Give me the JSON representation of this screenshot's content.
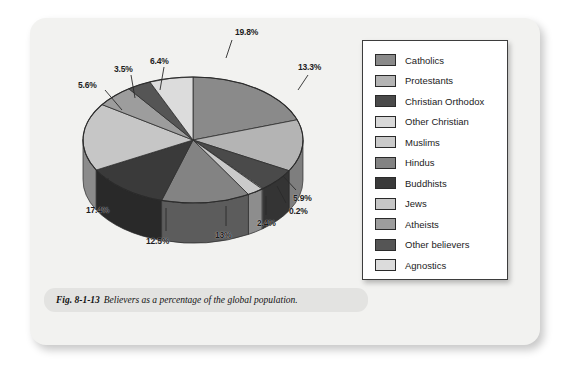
{
  "figure": {
    "caption_prefix": "Fig. 8-1-13",
    "caption_text": "Believers as a percentage of the global population.",
    "background_color": "#f2f2f0",
    "caption_bar_color": "#e3e3e1"
  },
  "chart_data": {
    "type": "pie",
    "title": "Believers as a percentage of the global population",
    "three_d": true,
    "legend_position": "right",
    "categories": [
      "Catholics",
      "Protestants",
      "Christian Orthodox",
      "Other Christian",
      "Muslims",
      "Hindus",
      "Buddhists",
      "Jews",
      "Atheists",
      "Other believers",
      "Agnostics"
    ],
    "values": [
      19.8,
      13.3,
      5.9,
      0.2,
      2.4,
      13,
      12.5,
      17.4,
      5.6,
      3.5,
      6.4
    ],
    "value_labels": [
      "19.8%",
      "13.3%",
      "5.9%",
      "0.2%",
      "2.4%",
      "13%",
      "12.5%",
      "17.4%",
      "5.6%",
      "3.5%",
      "6.4%"
    ],
    "colors": [
      "#8a8a8a",
      "#b4b4b4",
      "#4a4a4a",
      "#d8d8d8",
      "#cacaca",
      "#838383",
      "#3a3a3a",
      "#c6c6c6",
      "#9d9d9d",
      "#555555",
      "#dcdcdc"
    ],
    "units": "percent",
    "total": 100
  },
  "legend": {
    "items": [
      {
        "label": "Catholics",
        "color": "#8a8a8a"
      },
      {
        "label": "Protestants",
        "color": "#b4b4b4"
      },
      {
        "label": "Christian Orthodox",
        "color": "#4a4a4a"
      },
      {
        "label": "Other Christian",
        "color": "#d8d8d8"
      },
      {
        "label": "Muslims",
        "color": "#cacaca"
      },
      {
        "label": "Hindus",
        "color": "#838383"
      },
      {
        "label": "Buddhists",
        "color": "#3a3a3a"
      },
      {
        "label": "Jews",
        "color": "#c6c6c6"
      },
      {
        "label": "Atheists",
        "color": "#9d9d9d"
      },
      {
        "label": "Other believers",
        "color": "#555555"
      },
      {
        "label": "Agnostics",
        "color": "#dcdcdc"
      }
    ]
  }
}
